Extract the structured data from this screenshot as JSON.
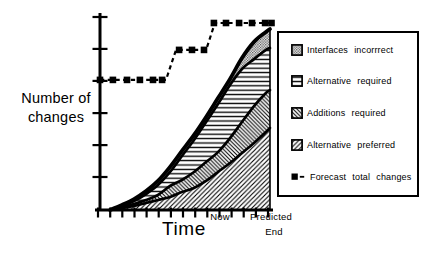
{
  "figure": {
    "ink_color": "#000000",
    "paper_color": "#ffffff",
    "accent_gray": "#3d3d3d"
  },
  "axes": {
    "y_label_lines": [
      "Number of",
      "changes"
    ],
    "x_label": "Time",
    "x_annotations": [
      {
        "text": "Now",
        "x_unit": 70
      },
      {
        "text": "Predicted",
        "x_unit": 100.6
      },
      {
        "text": "End",
        "x_unit": 101.8
      }
    ],
    "y_tick_units": [
      16.9,
      33.3,
      49.7,
      66.2,
      82.6,
      99.0
    ],
    "x_tick_units": [
      -1.2,
      6.0,
      13.1,
      20.3,
      27.4,
      34.5,
      41.7,
      48.8,
      56.0,
      63.1,
      70.3,
      77.4,
      84.5,
      91.7,
      98.8
    ]
  },
  "legend": {
    "items": [
      {
        "label": "Interfaces incorrrect",
        "pattern": "dots"
      },
      {
        "label": "Alternative required",
        "pattern": "horiz"
      },
      {
        "label": "Additions required",
        "pattern": "diag-back"
      },
      {
        "label": "Alternative preferred",
        "pattern": "diag-fwd"
      },
      {
        "label": "Forecast total changes",
        "pattern": "forecast-marker"
      }
    ]
  },
  "chart_data": {
    "type": "area",
    "stacked": true,
    "title": "",
    "xlabel": "Time",
    "ylabel": "Number of changes",
    "axis_note": "axes are unlabeled; values expressed as percent of axis length, x: 0=origin 100=Predicted End, y: 0=baseline 100=top tick",
    "xlim": [
      0,
      100
    ],
    "ylim": [
      0,
      100
    ],
    "x": [
      5.9,
      12.9,
      20.0,
      27.1,
      34.1,
      41.2,
      48.2,
      55.3,
      62.4,
      69.4,
      76.5,
      83.5,
      90.6,
      97.6,
      100
    ],
    "series": [
      {
        "name": "Alternative preferred",
        "pattern": "diag-fwd",
        "cumulative_top": [
          0,
          1.0,
          2.1,
          3.6,
          5.1,
          6.7,
          9.2,
          11.3,
          14.9,
          19.5,
          24.1,
          29.2,
          34.4,
          40.0,
          42.1
        ]
      },
      {
        "name": "Additions required",
        "pattern": "diag-back",
        "cumulative_top": [
          0,
          1.5,
          3.1,
          5.1,
          7.7,
          12.3,
          15.4,
          19.5,
          24.6,
          29.7,
          36.9,
          45.1,
          53.3,
          60.0,
          61.5
        ]
      },
      {
        "name": "Alternative required",
        "pattern": "horiz",
        "cumulative_top": [
          0,
          2.1,
          4.6,
          8.2,
          12.8,
          19.5,
          27.7,
          35.9,
          45.1,
          54.4,
          64.1,
          72.3,
          77.4,
          82.1,
          83.1
        ]
      },
      {
        "name": "Interfaces incorrrect",
        "pattern": "dots",
        "cumulative_top": [
          0,
          2.6,
          5.6,
          9.7,
          14.9,
          22.1,
          30.3,
          38.5,
          47.7,
          57.4,
          67.2,
          77.9,
          86.2,
          91.3,
          92.8
        ]
      }
    ],
    "forecast": {
      "name": "Forecast total changes",
      "style": "dashed-step-line-with-square-markers",
      "path": [
        [
          0,
          66.7
        ],
        [
          38.8,
          66.7
        ],
        [
          44.7,
          82.1
        ],
        [
          62.4,
          82.1
        ],
        [
          67.6,
          95.9
        ],
        [
          100.9,
          95.9
        ]
      ],
      "markers": [
        [
          0,
          66.7
        ],
        [
          7.6,
          66.7
        ],
        [
          15.9,
          66.7
        ],
        [
          23.5,
          66.7
        ],
        [
          31.2,
          66.7
        ],
        [
          36.5,
          66.7
        ],
        [
          46.5,
          82.1
        ],
        [
          54.1,
          82.1
        ],
        [
          61.2,
          82.1
        ],
        [
          67.0,
          95.9
        ],
        [
          74.1,
          95.9
        ],
        [
          81.8,
          95.9
        ],
        [
          89.4,
          95.9
        ],
        [
          97.1,
          95.9
        ],
        [
          100.9,
          95.9
        ]
      ]
    }
  }
}
